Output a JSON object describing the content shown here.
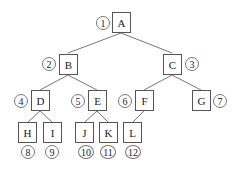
{
  "diagram": {
    "type": "binary-tree",
    "nodes": [
      {
        "id": "A",
        "label": "A",
        "order": "1"
      },
      {
        "id": "B",
        "label": "B",
        "order": "2"
      },
      {
        "id": "C",
        "label": "C",
        "order": "3"
      },
      {
        "id": "D",
        "label": "D",
        "order": "4"
      },
      {
        "id": "E",
        "label": "E",
        "order": "5"
      },
      {
        "id": "F",
        "label": "F",
        "order": "6"
      },
      {
        "id": "G",
        "label": "G",
        "order": "7"
      },
      {
        "id": "H",
        "label": "H",
        "order": "8"
      },
      {
        "id": "I",
        "label": "I",
        "order": "9"
      },
      {
        "id": "J",
        "label": "J",
        "order": "10"
      },
      {
        "id": "K",
        "label": "K",
        "order": "11"
      },
      {
        "id": "L",
        "label": "L",
        "order": "12"
      }
    ],
    "edges": [
      [
        "A",
        "B"
      ],
      [
        "A",
        "C"
      ],
      [
        "B",
        "D"
      ],
      [
        "B",
        "E"
      ],
      [
        "C",
        "F"
      ],
      [
        "C",
        "G"
      ],
      [
        "D",
        "H"
      ],
      [
        "D",
        "I"
      ],
      [
        "E",
        "J"
      ],
      [
        "E",
        "K"
      ],
      [
        "F",
        "L"
      ]
    ]
  }
}
